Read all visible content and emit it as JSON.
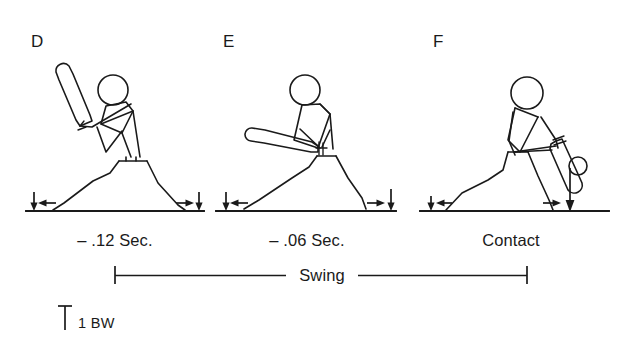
{
  "figure": {
    "background_color": "#ffffff",
    "ink_color": "#1a1a1a"
  },
  "panels": [
    {
      "letter": "D",
      "phase_label": "– .12 Sec.",
      "description": "batter at load position, bat angled up and back over rear shoulder",
      "left_foot_vertical_force_arrow": "down",
      "left_foot_horizontal_force_arrow": "left",
      "right_foot_horizontal_force_arrow": "right",
      "right_foot_vertical_force_arrow": "down"
    },
    {
      "letter": "E",
      "phase_label": "– .06 Sec.",
      "description": "batter mid-swing, bat extended horizontally forward",
      "left_foot_vertical_force_arrow": "down",
      "left_foot_horizontal_force_arrow": "left",
      "right_foot_horizontal_force_arrow": "right",
      "right_foot_vertical_force_arrow": "down"
    },
    {
      "letter": "F",
      "phase_label": "Contact",
      "description": "bat meets ball, front leg braced, large vertical force on front foot",
      "left_foot_vertical_force_arrow": "down",
      "left_foot_horizontal_force_arrow": "left",
      "right_foot_horizontal_force_arrow": "right",
      "right_foot_vertical_force_arrow": "down-large"
    }
  ],
  "span_bracket": {
    "label": "Swing"
  },
  "scale_marker": {
    "label": "1 BW",
    "icon": "vertical-scale-bar-icon"
  }
}
